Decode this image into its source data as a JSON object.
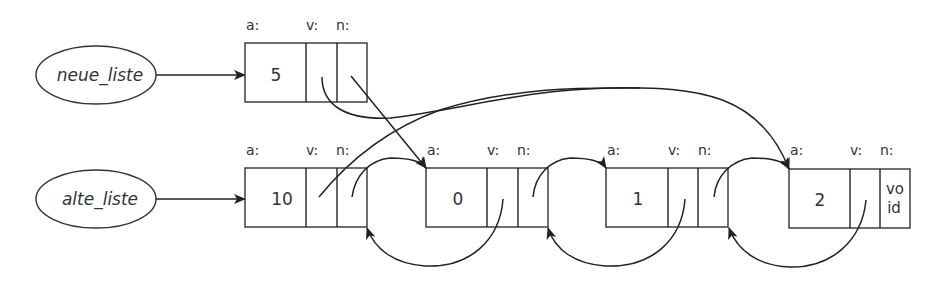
{
  "diagram": {
    "type": "linked-list-memory-diagram",
    "variables": [
      {
        "name": "neue_liste"
      },
      {
        "name": "alte_liste"
      }
    ],
    "field_labels": {
      "a": "a:",
      "v": "v:",
      "n": "n:"
    },
    "nodes": [
      {
        "id": "node_neu",
        "value": "5",
        "row": "top"
      },
      {
        "id": "node_10",
        "value": "10",
        "row": "bottom"
      },
      {
        "id": "node_0",
        "value": "0",
        "row": "bottom"
      },
      {
        "id": "node_1",
        "value": "1",
        "row": "bottom"
      },
      {
        "id": "node_2",
        "value": "2",
        "row": "bottom",
        "n_text_line1": "vo",
        "n_text_line2": "id"
      }
    ],
    "edges": [
      {
        "from": "neue_liste",
        "to": "node_neu"
      },
      {
        "from": "alte_liste",
        "to": "node_10"
      },
      {
        "from": "node_neu.v",
        "to": "node_2"
      },
      {
        "from": "node_neu.n",
        "to": "node_0"
      },
      {
        "from": "node_10.v",
        "to": "node_2"
      },
      {
        "from": "node_10.n",
        "to": "node_0"
      },
      {
        "from": "node_0.v",
        "to": "node_10.n"
      },
      {
        "from": "node_0.n",
        "to": "node_1"
      },
      {
        "from": "node_1.v",
        "to": "node_0.n"
      },
      {
        "from": "node_1.n",
        "to": "node_2"
      },
      {
        "from": "node_2.v",
        "to": "node_1.n"
      }
    ]
  }
}
